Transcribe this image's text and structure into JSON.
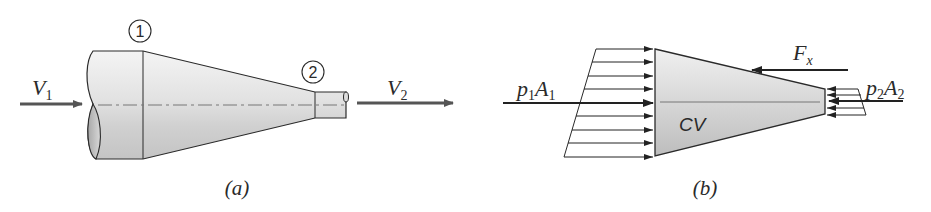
{
  "figure_a": {
    "caption": "(a)",
    "section_1_label": "1",
    "section_2_label": "2",
    "inlet_velocity": {
      "symbol": "V",
      "subscript": "1"
    },
    "outlet_velocity": {
      "symbol": "V",
      "subscript": "2"
    }
  },
  "figure_b": {
    "caption": "(b)",
    "control_volume_label": "CV",
    "inlet_force": {
      "symbol_p": "p",
      "sub_p": "1",
      "symbol_A": "A",
      "sub_A": "1"
    },
    "outlet_force": {
      "symbol_p": "p",
      "sub_p": "2",
      "symbol_A": "A",
      "sub_A": "2"
    },
    "reaction_force": {
      "symbol": "F",
      "subscript": "x"
    }
  },
  "colors": {
    "stroke": "#2a2a2a",
    "arrow_gray": "#555555",
    "fill_light": "#f2f2f2",
    "fill_dark": "#b8b8b8"
  }
}
